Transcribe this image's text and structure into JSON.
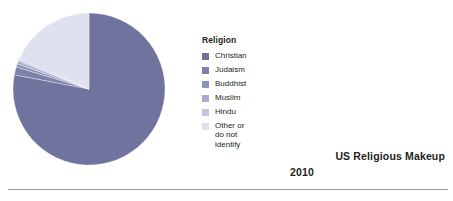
{
  "figure": {
    "title": "US Religious Makeup",
    "subtitle": "2010",
    "background_color": "#ffffff",
    "rule_color": "#9a9a9a"
  },
  "legend": {
    "title": "Religion",
    "position": "right-of-pie",
    "items": [
      {
        "label": "Christian",
        "color": "#6f739e"
      },
      {
        "label": "Judaism",
        "color": "#7d80a8"
      },
      {
        "label": "Buddhist",
        "color": "#8f93b6"
      },
      {
        "label": "Muslim",
        "color": "#a9accb"
      },
      {
        "label": "Hindu",
        "color": "#c3c6dd"
      },
      {
        "label": "Other or\ndo not\nidentify",
        "color": "#dfe2ee"
      }
    ]
  },
  "chart_data": {
    "type": "pie",
    "title": "US Religious Makeup",
    "subtitle": "2010",
    "xlabel": "",
    "ylabel": "",
    "legend_title": "Religion",
    "legend_position": "right",
    "grid": false,
    "start_angle_deg": 0,
    "direction": "clockwise",
    "units": "percent",
    "categories": [
      "Christian",
      "Judaism",
      "Buddhist",
      "Muslim",
      "Hindu",
      "Other or do not identify"
    ],
    "values": [
      78.0,
      1.7,
      0.7,
      0.6,
      0.4,
      18.6
    ],
    "colors": [
      "#6f739e",
      "#7d80a8",
      "#8f93b6",
      "#a9accb",
      "#c3c6dd",
      "#dfe2ee"
    ],
    "series": [
      {
        "name": "Religion",
        "values": [
          78.0,
          1.7,
          0.7,
          0.6,
          0.4,
          18.6
        ]
      }
    ]
  }
}
